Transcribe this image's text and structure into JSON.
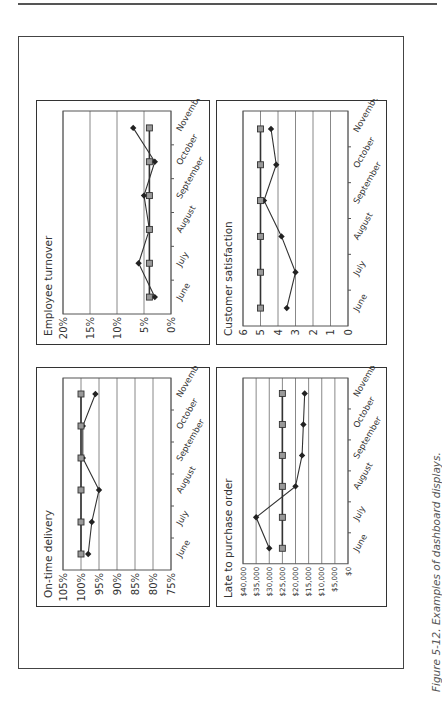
{
  "figure": {
    "caption": "Figure 5-12. Examples of dashboard displays.",
    "orientation": "rotated -90 degrees"
  },
  "panels": [
    {
      "id": "employee_turnover",
      "title": "Employee turnover"
    },
    {
      "id": "on_time_delivery",
      "title": "On-time delivery"
    },
    {
      "id": "customer_satisfaction",
      "title": "Customer satisfaction"
    },
    {
      "id": "late_to_purchase_order",
      "title": "Late to purchase order"
    }
  ],
  "colors": {
    "line": "#333333",
    "target_marker_fill": "#999999",
    "grid": "#888888",
    "border": "#333333"
  },
  "chart_data": [
    {
      "type": "line",
      "title": "Employee turnover",
      "categories": [
        "June",
        "July",
        "August",
        "September",
        "October",
        "November"
      ],
      "series": [
        {
          "name": "Actual",
          "marker": "diamond",
          "values": [
            3,
            6,
            4,
            5,
            3,
            7
          ]
        },
        {
          "name": "Target",
          "marker": "square",
          "values": [
            4,
            4,
            4,
            4,
            4,
            4
          ]
        }
      ],
      "yticks": [
        "0%",
        "5%",
        "10%",
        "15%",
        "20%"
      ],
      "ylim": [
        0,
        20
      ],
      "grid": true,
      "xlabel": "",
      "ylabel": ""
    },
    {
      "type": "line",
      "title": "On-time delivery",
      "categories": [
        "June",
        "July",
        "August",
        "September",
        "October",
        "November"
      ],
      "series": [
        {
          "name": "Actual",
          "marker": "diamond",
          "values": [
            98,
            97,
            95,
            99.5,
            99.5,
            96
          ]
        },
        {
          "name": "Target",
          "marker": "square",
          "values": [
            100,
            100,
            100,
            100,
            100,
            100
          ]
        }
      ],
      "yticks": [
        "75%",
        "80%",
        "85%",
        "90%",
        "95%",
        "100%",
        "105%"
      ],
      "ylim": [
        75,
        105
      ],
      "grid": true,
      "xlabel": "",
      "ylabel": ""
    },
    {
      "type": "line",
      "title": "Customer satisfaction",
      "categories": [
        "June",
        "July",
        "August",
        "September",
        "October",
        "November"
      ],
      "series": [
        {
          "name": "Actual",
          "marker": "diamond",
          "values": [
            3.5,
            3,
            3.8,
            4.8,
            4.1,
            4.4
          ]
        },
        {
          "name": "Target",
          "marker": "square",
          "values": [
            5,
            5,
            5,
            5,
            5,
            5
          ]
        }
      ],
      "yticks": [
        "0",
        "1",
        "2",
        "3",
        "4",
        "5",
        "6"
      ],
      "ylim": [
        0,
        6
      ],
      "grid": true,
      "xlabel": "",
      "ylabel": ""
    },
    {
      "type": "line",
      "title": "Late to purchase order",
      "categories": [
        "June",
        "July",
        "August",
        "September",
        "October",
        "November"
      ],
      "series": [
        {
          "name": "Actual",
          "marker": "diamond",
          "values": [
            30000,
            35000,
            20000,
            17500,
            17000,
            16500
          ]
        },
        {
          "name": "Target",
          "marker": "square",
          "values": [
            25000,
            25000,
            25000,
            25000,
            25000,
            25000
          ]
        }
      ],
      "yticks": [
        "$0",
        "$5,000",
        "$10,000",
        "$15,000",
        "$20,000",
        "$25,000",
        "$30,000",
        "$35,000",
        "$40,000"
      ],
      "ylim": [
        0,
        40000
      ],
      "grid": true,
      "xlabel": "",
      "ylabel": ""
    }
  ]
}
